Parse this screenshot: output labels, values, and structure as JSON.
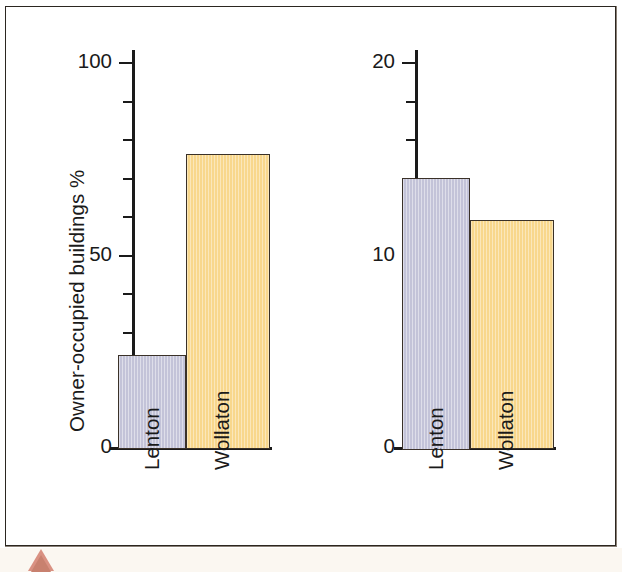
{
  "figure": {
    "marker_icon": "triangle-marker-icon",
    "frame_color": "#2b2620",
    "background_color": "#ffffff",
    "paper_color": "#fbf7f1",
    "marker_color": "#d99182"
  },
  "series_colors": {
    "lenton": "#c3c3d8",
    "wollaton": "#f8d78c",
    "outline": "#3a3128",
    "axis": "#1a1a1a"
  },
  "chart_data": [
    {
      "type": "bar",
      "title": "",
      "ylabel": "Owner-occupied buildings %",
      "xlabel": "",
      "categories": [
        "Lenton",
        "Wollaton"
      ],
      "values": [
        24,
        76
      ],
      "ylim": [
        0,
        100
      ],
      "major_ticks": [
        0,
        50,
        100
      ],
      "major_tick_labels": [
        "0",
        "50",
        "100"
      ],
      "minor_tick_step": 10,
      "grid": false,
      "legend": "none"
    },
    {
      "type": "bar",
      "title": "",
      "ylabel": "Homes with no central heating %",
      "xlabel": "",
      "categories": [
        "Lenton",
        "Wollaton"
      ],
      "values": [
        14,
        11.8
      ],
      "ylim": [
        0,
        20
      ],
      "major_ticks": [
        0,
        10,
        20
      ],
      "major_tick_labels": [
        "0",
        "10",
        "20"
      ],
      "minor_tick_step": 2,
      "grid": false,
      "legend": "none"
    }
  ]
}
